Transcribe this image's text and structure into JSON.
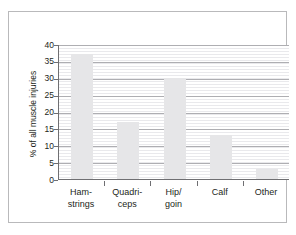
{
  "chart_data": {
    "type": "bar",
    "title": "",
    "subtitle": "",
    "xlabel": "",
    "ylabel": "% of all muscle injuries",
    "categories": [
      "Ham-\nstrings",
      "Quadri-\nceps",
      "Hip/\ngoin",
      "Calf",
      "Other"
    ],
    "category_lines": [
      [
        "Ham-",
        "strings"
      ],
      [
        "Quadri-",
        "ceps"
      ],
      [
        "Hip/",
        "goin"
      ],
      [
        "Calf",
        ""
      ],
      [
        "Other",
        ""
      ]
    ],
    "values": [
      37,
      17,
      30,
      13,
      3
    ],
    "ylim": [
      0,
      40
    ],
    "ytick_values": [
      0,
      5,
      10,
      15,
      20,
      25,
      30,
      35,
      40
    ],
    "ytick_labels": [
      "0",
      "5",
      "10",
      "15",
      "20",
      "25",
      "30",
      "35",
      "40"
    ],
    "grid": "horizontal",
    "legend": "none",
    "bar_color": "#e6e6e8",
    "axis_color": "#6f6f72",
    "gridline_color": "#aeaeb2",
    "minor_gridline_color": "#e9e9ec",
    "frame_color": "#b9b9bb",
    "text_color": "#231f20"
  }
}
